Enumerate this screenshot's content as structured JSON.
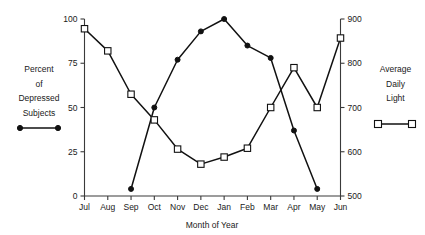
{
  "chart_data": {
    "type": "line",
    "title": "",
    "xlabel": "Month of Year",
    "categories": [
      "Jul",
      "Aug",
      "Sep",
      "Oct",
      "Nov",
      "Dec",
      "Jan",
      "Feb",
      "Mar",
      "Apr",
      "May",
      "Jun"
    ],
    "grid": false,
    "axes": {
      "left": {
        "label_lines": [
          "Percent",
          "of",
          "Depressed",
          "Subjects"
        ],
        "ticks": [
          0,
          25,
          50,
          75,
          100
        ],
        "ylim": [
          0,
          100
        ],
        "marker": "filled-circle"
      },
      "right": {
        "label_lines": [
          "Average",
          "Daily",
          "Light"
        ],
        "ticks": [
          500,
          600,
          700,
          800,
          900
        ],
        "ylim": [
          500,
          900
        ],
        "marker": "open-square"
      }
    },
    "series": [
      {
        "name": "Percent of Depressed Subjects",
        "axis": "left",
        "marker": "filled-circle",
        "color": "#111111",
        "x": [
          "Sep",
          "Oct",
          "Nov",
          "Dec",
          "Jan",
          "Feb",
          "Mar",
          "Apr",
          "May"
        ],
        "values": [
          4,
          50,
          77,
          93,
          100,
          85,
          78,
          37,
          4
        ]
      },
      {
        "name": "Average Daily Light",
        "axis": "right",
        "marker": "open-square",
        "color": "#111111",
        "x": [
          "Jul",
          "Aug",
          "Sep",
          "Oct",
          "Nov",
          "Dec",
          "Jan",
          "Feb",
          "Mar",
          "Apr",
          "May",
          "Jun"
        ],
        "values": [
          878,
          828,
          730,
          672,
          606,
          572,
          588,
          608,
          700,
          790,
          700,
          857
        ]
      }
    ],
    "series_left_percent": [
      4,
      50,
      77,
      93,
      100,
      85,
      78,
      37,
      4
    ],
    "series_right_percent_equivalent": [
      94.5,
      82,
      57.5,
      43,
      26,
      17.5,
      22,
      27,
      50,
      72.5,
      50,
      89
    ]
  },
  "legend": {
    "left": {
      "lines": [
        "Percent",
        "of",
        "Depressed",
        "Subjects"
      ],
      "marker": "filled-circle-line"
    },
    "right": {
      "lines": [
        "Average",
        "Daily",
        "Light"
      ],
      "marker": "open-square-line"
    }
  },
  "axis_labels": {
    "x_title": "Month of Year",
    "x_ticks": [
      "Jul",
      "Aug",
      "Sep",
      "Oct",
      "Nov",
      "Dec",
      "Jan",
      "Feb",
      "Mar",
      "Apr",
      "May",
      "Jun"
    ],
    "y_left_ticks": [
      "0",
      "25",
      "50",
      "75",
      "100"
    ],
    "y_right_ticks": [
      "500",
      "600",
      "700",
      "800",
      "900"
    ]
  },
  "colors": {
    "line": "#111111",
    "axis": "#3a3a3a",
    "background": "#ffffff",
    "marker_fill_open": "#ffffff"
  }
}
